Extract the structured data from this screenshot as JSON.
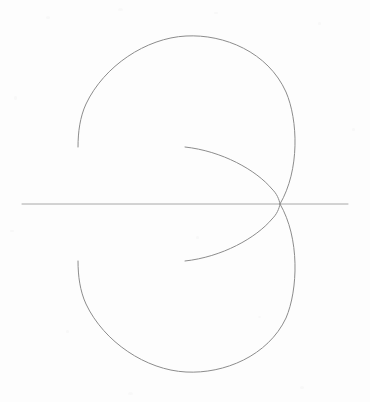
{
  "figure": {
    "kind": "polar-curve-diagram",
    "background_color": "#fdfdfd",
    "caption": "",
    "title": "",
    "labels": []
  },
  "chart_data": {
    "type": "line",
    "title": "",
    "subtitle": "",
    "xlabel": "",
    "ylabel": "",
    "grid": false,
    "legend": null,
    "axis_line": {
      "name": "horizontal-axis",
      "orientation": "horizontal",
      "y": 204,
      "x_start": 22,
      "x_end": 348,
      "color": "#a8a8a8",
      "width": 1
    },
    "pole": {
      "x": 280,
      "y": 204
    },
    "xlim": [
      22,
      348
    ],
    "ylim": [
      36,
      372
    ],
    "series": [
      {
        "name": "outer-curve-upper-lobe",
        "color": "#8c8c8c",
        "width": 1,
        "path": "M 280 204 C 300 170 298 120 286 92 C 268 52 224 34 186 36 C 146 38 104 66 86 104 C 80 117 78 132 78 147",
        "start_point": {
          "x": 280,
          "y": 204
        },
        "end_point": {
          "x": 78,
          "y": 147
        },
        "extreme_top": {
          "x": 186,
          "y": 36
        },
        "extreme_right": {
          "x": 297,
          "y": 125
        },
        "extreme_left": {
          "x": 78,
          "y": 147
        }
      },
      {
        "name": "outer-curve-lower-lobe",
        "color": "#8c8c8c",
        "width": 1,
        "path": "M 280 204 C 300 238 298 290 286 318 C 268 356 224 374 186 372 C 146 370 104 342 86 304 C 80 291 78 276 78 261",
        "start_point": {
          "x": 280,
          "y": 204
        },
        "end_point": {
          "x": 78,
          "y": 261
        },
        "extreme_bottom": {
          "x": 186,
          "y": 372
        },
        "extreme_right": {
          "x": 297,
          "y": 283
        },
        "extreme_left": {
          "x": 78,
          "y": 261
        }
      },
      {
        "name": "inner-arc-upper",
        "color": "#8c8c8c",
        "width": 1,
        "path": "M 185 147 C 222 151 256 170 272 189 C 277 194 279 199 280 204",
        "start_point": {
          "x": 185,
          "y": 147
        },
        "end_point": {
          "x": 280,
          "y": 204
        }
      },
      {
        "name": "inner-arc-lower",
        "color": "#8c8c8c",
        "width": 1,
        "path": "M 280 204 C 279 209 277 214 272 219 C 256 238 222 257 185 261",
        "start_point": {
          "x": 280,
          "y": 204
        },
        "end_point": {
          "x": 185,
          "y": 261
        }
      }
    ],
    "annotations": []
  },
  "speckles": [
    {
      "x": 46,
      "y": 16,
      "w": 4,
      "h": 3
    },
    {
      "x": 118,
      "y": 8,
      "w": 5,
      "h": 3
    },
    {
      "x": 214,
      "y": 12,
      "w": 4,
      "h": 2
    },
    {
      "x": 318,
      "y": 22,
      "w": 3,
      "h": 3
    },
    {
      "x": 14,
      "y": 96,
      "w": 3,
      "h": 4
    },
    {
      "x": 352,
      "y": 128,
      "w": 3,
      "h": 3
    },
    {
      "x": 10,
      "y": 230,
      "w": 4,
      "h": 2
    },
    {
      "x": 196,
      "y": 236,
      "w": 3,
      "h": 3
    },
    {
      "x": 258,
      "y": 316,
      "w": 3,
      "h": 2
    },
    {
      "x": 128,
      "y": 392,
      "w": 5,
      "h": 3
    },
    {
      "x": 300,
      "y": 386,
      "w": 4,
      "h": 3
    },
    {
      "x": 66,
      "y": 330,
      "w": 3,
      "h": 3
    }
  ]
}
